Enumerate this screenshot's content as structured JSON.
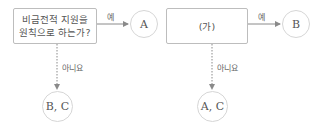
{
  "flowcharts": [
    {
      "question_lines": [
        "비금전적 지원을",
        "원칙으로 하는가?"
      ],
      "yes_label": "예",
      "no_label": "아니요",
      "yes_result": "A",
      "no_result": "B, C"
    },
    {
      "question_lines": [
        "(가)"
      ],
      "yes_label": "예",
      "no_label": "아니요",
      "yes_result": "B",
      "no_result": "A, C"
    }
  ],
  "colors": {
    "box_border": "#bdbdbd",
    "circle_border": "#d6d6d6",
    "arrow": "#8a8a8a",
    "text": "#555555"
  }
}
